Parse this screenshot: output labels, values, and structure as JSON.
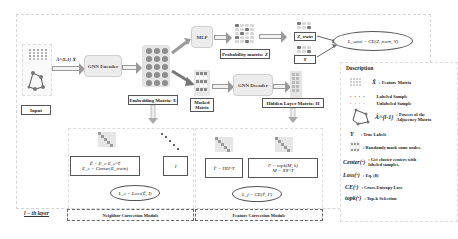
{
  "input": {
    "label": "Input"
  },
  "edge_label": "Â^{l-1} X̂",
  "encoder": {
    "label": "GNN Encoder"
  },
  "embedding": {
    "label": "Embedding Matrix: E"
  },
  "mlp": {
    "label": "MLP"
  },
  "probability": {
    "label": "Probability matrix: Z"
  },
  "z_train": {
    "label": "Z_train"
  },
  "y_true": {
    "label": "Y"
  },
  "loss_semi": {
    "label": "L_semi = CE(Z_train, Y)"
  },
  "masked": {
    "label": "Masked Matrix"
  },
  "decoder": {
    "label": "GNN Decoder"
  },
  "hidden": {
    "label": "Hidden Layer Matrix: H"
  },
  "neighbor_module": {
    "formula_line1": "Ê = E_c E_c^T",
    "formula_line2": "E_c = Center(E_train)",
    "identity": "I",
    "loss": "L_c = Loss(Ê, I)",
    "label": "Neighbor Correction Module"
  },
  "feature_module": {
    "formula_left": "F̂ = HH^T",
    "formula_right_line1": "F = topk(M, k)",
    "formula_right_line2": "M = XX^T",
    "loss": "L_f = CE(F̂, F)",
    "label": "Feature Correction Module"
  },
  "layer_label": "l − th layer",
  "description": {
    "title": "Description",
    "items": [
      {
        "symbol": "X̂",
        "text": ": Feature Matrix"
      },
      {
        "symbol": "",
        "text": "Labeled Sample"
      },
      {
        "symbol": "",
        "text": "Unlabeled Sample"
      },
      {
        "symbol": "Â^{l-1}",
        "text": ": Powers of the Adjacency Matrix"
      },
      {
        "symbol": "Y",
        "text": ": True Labels"
      },
      {
        "symbol": "",
        "text": ": Randomly mask some nodes."
      },
      {
        "symbol": "Center(·)",
        "text": ": Get cluster centers with labeled samples."
      },
      {
        "symbol": "Loss(·)",
        "text": ": Eq. (8)"
      },
      {
        "symbol": "CE(·)",
        "text": ": Cross-Entropy Loss"
      },
      {
        "symbol": "topk(·)",
        "text": ": Top-k Selection"
      }
    ]
  }
}
